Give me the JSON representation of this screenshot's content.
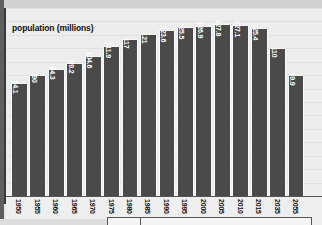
{
  "chart_data": {
    "type": "bar",
    "title": "population (millions)",
    "xlabel": "",
    "ylabel": "population (millions)",
    "categories": [
      "1950",
      "1955",
      "1960",
      "1965",
      "1970",
      "1975",
      "1980",
      "1985",
      "1990",
      "1995",
      "2000",
      "2005",
      "2010",
      "2015",
      "2035",
      "2055"
    ],
    "values": [
      84.1,
      90,
      94.3,
      99.2,
      104.6,
      111.9,
      117,
      121,
      123.6,
      125.5,
      126.9,
      127.8,
      127.1,
      125.4,
      110,
      89.9
    ],
    "value_labels": [
      "84.1",
      "90",
      "94.3",
      "99.2",
      "104.6",
      "111.9",
      "117",
      "121",
      "123.6",
      "125.5",
      "126.9",
      "127.8",
      "127.1",
      "125.4",
      "110",
      "89.9"
    ],
    "ylim": [
      0,
      140
    ],
    "grid": true,
    "legend": "none",
    "bar_color": "#4a4a4a",
    "label_color": "#ffffff",
    "background_color": "#ededed"
  },
  "chart": {
    "title": "population (millions)"
  }
}
